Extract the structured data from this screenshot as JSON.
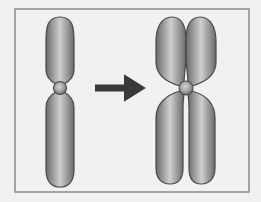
{
  "diagram": {
    "type": "chromosome-replication",
    "background": "#f1f1f1",
    "frame": {
      "x": 15,
      "y": 9,
      "width": 234,
      "height": 183,
      "stroke": "#8a8a8a"
    },
    "left_chromosome": {
      "label": "unreplicated chromosome",
      "centromere": {
        "cx": 60,
        "cy": 88,
        "r": 6.5
      },
      "arms": [
        {
          "name": "upper-arm",
          "cx": 60,
          "top": 17,
          "bottom": 84,
          "width": 27
        },
        {
          "name": "lower-arm",
          "cx": 60,
          "top": 92,
          "bottom": 187,
          "width": 27
        }
      ]
    },
    "arrow": {
      "x1": 95,
      "x2": 143,
      "y": 88,
      "color": "#3a3a3a"
    },
    "right_chromosome": {
      "label": "replicated chromosome (two sister chromatids)",
      "centromere": {
        "cx": 186,
        "cy": 88,
        "r": 7
      },
      "chromatids": [
        "left-chromatid",
        "right-chromatid"
      ]
    },
    "colors": {
      "chromosome_fill_light": "#c9c9c9",
      "chromosome_fill_mid": "#9a9a9a",
      "chromosome_fill_dark": "#6a6a6a",
      "chromosome_outline": "#4a4a4a"
    }
  }
}
